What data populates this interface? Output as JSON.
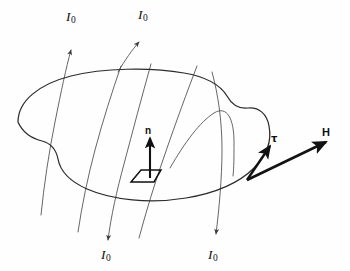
{
  "figure": {
    "kind": "physics-diagram",
    "background_color": "#fefefe",
    "stroke_color": "#2b2b2b",
    "field_line_color": "#4a4a4a",
    "bold_vector_color": "#121212",
    "width": 350,
    "height": 271
  },
  "labels": {
    "current_top_left": {
      "symbol": "I",
      "subscript": "0",
      "x": 66,
      "y": 10
    },
    "current_top_right": {
      "symbol": "I",
      "subscript": "0",
      "x": 138,
      "y": 8
    },
    "current_bottom_left": {
      "symbol": "I",
      "subscript": "0",
      "x": 101,
      "y": 248
    },
    "current_bottom_right": {
      "symbol": "I",
      "subscript": "0",
      "x": 208,
      "y": 248
    },
    "normal": {
      "text": "n",
      "x": 145,
      "y": 128
    },
    "tangent": {
      "text": "τ",
      "x": 271,
      "y": 134
    },
    "field": {
      "text": "H",
      "x": 322,
      "y": 128
    }
  },
  "geometry": {
    "surface_outline": "M 18,122 C 18,100 40,83 72,75 C 104,67 150,66 184,72 C 208,76 222,85 228,95 C 233,104 239,108 248,107 C 258,106 266,113 268,125 C 271,140 266,155 254,167 C 240,181 216,192 186,197 C 150,203 113,199 88,188 C 70,180 60,169 58,158 C 56,148 50,142 42,140 C 30,137 22,131 18,122 Z",
    "notch_left_note": "concave inlet at left-lower side of blob",
    "bump_right_note": "small convex lobe at right side near vectors",
    "field_lines": [
      {
        "name": "line-1",
        "path": "M 41,215 C 44,185 49,152 55,122 C 61,92 66,68 71,46",
        "arrow": "up",
        "arrow_at": [
          71,
          46
        ]
      },
      {
        "name": "line-2",
        "path": "M 78,232 C 82,205 88,176 95,150 C 103,120 112,92 121,66",
        "arrow": "none"
      },
      {
        "name": "line-3",
        "path": "M 107,248 C 110,222 116,192 124,164 C 133,130 142,96 151,64",
        "arrow": "down",
        "arrow_at": [
          107,
          242
        ]
      },
      {
        "name": "line-4",
        "path": "M 139,238 C 146,212 155,182 165,154 C 176,122 187,92 197,66",
        "arrow": "none"
      },
      {
        "name": "line-5",
        "path": "M 215,240 C 219,210 222,178 222,150 C 222,120 218,94 212,72",
        "arrow": "down",
        "arrow_at": [
          215,
          234
        ]
      },
      {
        "name": "line-6",
        "path": "M 122,66 C 128,56 134,48 140,42",
        "arrow": "up",
        "arrow_at": [
          140,
          38
        ]
      },
      {
        "name": "line-7-arc",
        "path": "M 172,165 C 186,142 200,122 214,114 C 226,107 233,118 234,140 C 235,155 235,166 234,175",
        "arrow": "none"
      }
    ],
    "normal_vector": {
      "from": [
        150,
        178
      ],
      "to": [
        150,
        137
      ]
    },
    "area_element": "M 131,181 L 141,170 L 160,170 L 153,181 Z",
    "tangent_vector": {
      "from": [
        247,
        180
      ],
      "to": [
        272,
        144
      ]
    },
    "field_vector": {
      "from": [
        247,
        180
      ],
      "to": [
        330,
        140
      ]
    }
  }
}
